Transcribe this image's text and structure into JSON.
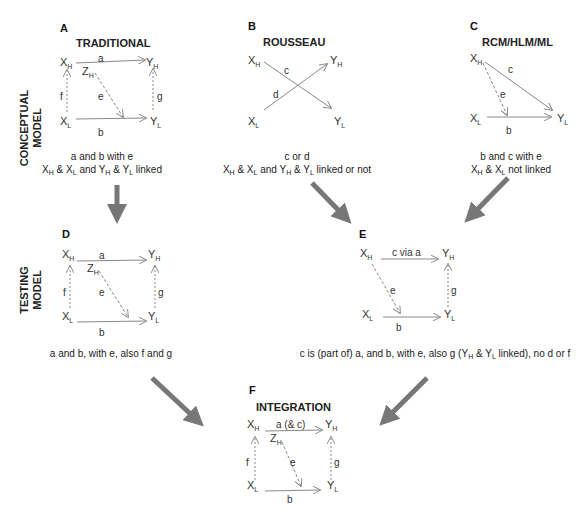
{
  "side_labels": {
    "conceptual": [
      "CONCEPTUAL",
      "MODEL"
    ],
    "testing": [
      "TESTING",
      "MODEL"
    ]
  },
  "panels": {
    "A": {
      "letter": "A",
      "title": "TRADITIONAL",
      "paths": {
        "top": "a",
        "bottom": "b",
        "left": "f",
        "right": "g",
        "diag": "e"
      },
      "z": "Z",
      "z_sub": "H",
      "caption1": "a and b with e",
      "caption2": "X_H & X_L and Y_H & Y_L linked"
    },
    "B": {
      "letter": "B",
      "title": "ROUSSEAU",
      "paths": {
        "c": "c",
        "d": "d"
      },
      "caption1": "c or d",
      "caption2": "X_H & X_L and Y_H & Y_L linked or not"
    },
    "C": {
      "letter": "C",
      "title": "RCM/HLM/ML",
      "paths": {
        "c": "c",
        "e": "e",
        "b": "b"
      },
      "caption1": "b and c with e",
      "caption2": "X_H & X_L not linked"
    },
    "D": {
      "letter": "D",
      "title": "",
      "paths": {
        "top": "a",
        "bottom": "b",
        "left": "f",
        "right": "g",
        "diag": "e"
      },
      "z": "Z",
      "z_sub": "H",
      "caption1": "a and b, with e, also f and g"
    },
    "E": {
      "letter": "E",
      "title": "",
      "paths": {
        "top": "c via a",
        "bottom": "b",
        "right": "g",
        "diag": "e"
      },
      "caption1": "c is (part of) a, and b, with e, also g (Y_H & Y_L linked), no d or f"
    },
    "F": {
      "letter": "F",
      "title": "INTEGRATION",
      "paths": {
        "top": "a (& c)",
        "bottom": "b",
        "left": "f",
        "right": "g",
        "diag": "e"
      },
      "z": "Z",
      "z_sub": "H"
    }
  },
  "nodes": {
    "x": "X",
    "y": "Y",
    "high": "H",
    "low": "L"
  },
  "colors": {
    "arrow_big": "#777777",
    "line": "#888888",
    "text": "#222222"
  }
}
